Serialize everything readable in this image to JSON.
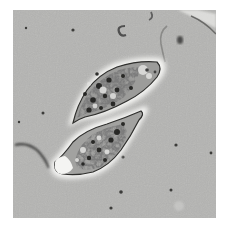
{
  "image": {
    "subject": "phase-contrast micrograph of two elongated cells",
    "colors": {
      "border": "#ffffff",
      "background": "#b4b4b2",
      "cell_halo": "#f2f2f0",
      "cell_interior": "#8a8a88",
      "granules": "#3a3a38",
      "debris": "#5a5a58"
    },
    "cells": [
      {
        "name": "upper-cell",
        "orientation": "diagonal, tapering to lower-left"
      },
      {
        "name": "lower-cell",
        "orientation": "diagonal, tapering to upper-right, bright blunt end at lower-left"
      }
    ]
  }
}
